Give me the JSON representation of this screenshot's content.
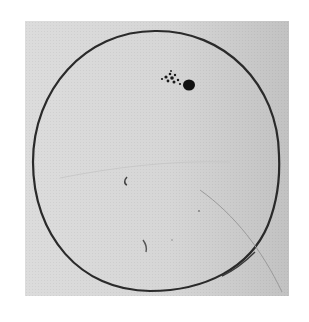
{
  "image": {
    "subject": "hand-drawn solar disk with sunspot group",
    "background_color": "#d8d8d8",
    "outline_color": "#2a2a2a"
  },
  "disk": {
    "cx": 156,
    "cy": 161,
    "rx": 123,
    "ry": 129
  },
  "sunspots": {
    "main": {
      "cx": 189,
      "cy": 85,
      "rx": 6,
      "ry": 5.5
    },
    "cluster": [
      {
        "cx": 166,
        "cy": 77,
        "r": 1.6
      },
      {
        "cx": 170,
        "cy": 74,
        "r": 1.3
      },
      {
        "cx": 172,
        "cy": 78,
        "r": 1.8
      },
      {
        "cx": 175,
        "cy": 75,
        "r": 1.2
      },
      {
        "cx": 162,
        "cy": 79,
        "r": 1.1
      },
      {
        "cx": 168,
        "cy": 81,
        "r": 1.4
      },
      {
        "cx": 174,
        "cy": 82,
        "r": 1.5
      },
      {
        "cx": 178,
        "cy": 80,
        "r": 1.2
      },
      {
        "cx": 180,
        "cy": 84,
        "r": 1.1
      },
      {
        "cx": 171,
        "cy": 71,
        "r": 0.9
      }
    ]
  }
}
